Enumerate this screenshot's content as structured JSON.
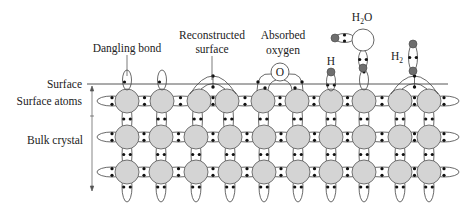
{
  "labels": {
    "dangling_bond": "Dangling bond",
    "reconstructed_line1": "Reconstructed",
    "reconstructed_line2": "surface",
    "absorbed_line1": "Absorbed",
    "absorbed_line2": "oxygen",
    "h": "H",
    "h2o_h": "H",
    "h2o_sub": "2",
    "h2o_o": "O",
    "h2_h": "H",
    "h2_sub": "2",
    "oxygen_atom": "O",
    "surface": "Surface",
    "surface_atoms": "Surface atoms",
    "bulk_crystal": "Bulk crystal"
  },
  "colors": {
    "atom_fill": "#d4d4d4",
    "atom_stroke": "#555555",
    "adsorbate_fill": "#6e6e6e",
    "line": "#444444",
    "electron": "#111111"
  },
  "lattice": {
    "rows_y": [
      101,
      137,
      172
    ],
    "bulk_x": [
      127,
      161,
      196,
      230,
      264,
      298,
      331,
      364,
      400,
      429
    ],
    "surface_x": [
      127,
      162,
      199,
      227,
      263,
      297,
      331,
      364,
      400,
      429
    ],
    "atom_radius": 12,
    "surface_line_y": 84,
    "surface_line_x": [
      87,
      448
    ]
  },
  "features": {
    "dangling_bonds_x": [
      127,
      162
    ],
    "reconstructed_pairs": [
      [
        199,
        227
      ],
      [
        400,
        429
      ]
    ],
    "oxygen": {
      "x": 280,
      "y": 72,
      "r": 9,
      "pair": [
        263,
        297
      ]
    },
    "h_adatom": {
      "x": 331,
      "y": 72,
      "r": 4
    },
    "h2o": {
      "o_x": 363,
      "o_y": 40,
      "o_r": 11,
      "h_left": [
        335,
        38
      ],
      "h_bottom": [
        363,
        68
      ]
    },
    "h2": {
      "x": 413,
      "y_top": 44,
      "y_bottom": 71
    },
    "lone_dangling_x": 364
  }
}
